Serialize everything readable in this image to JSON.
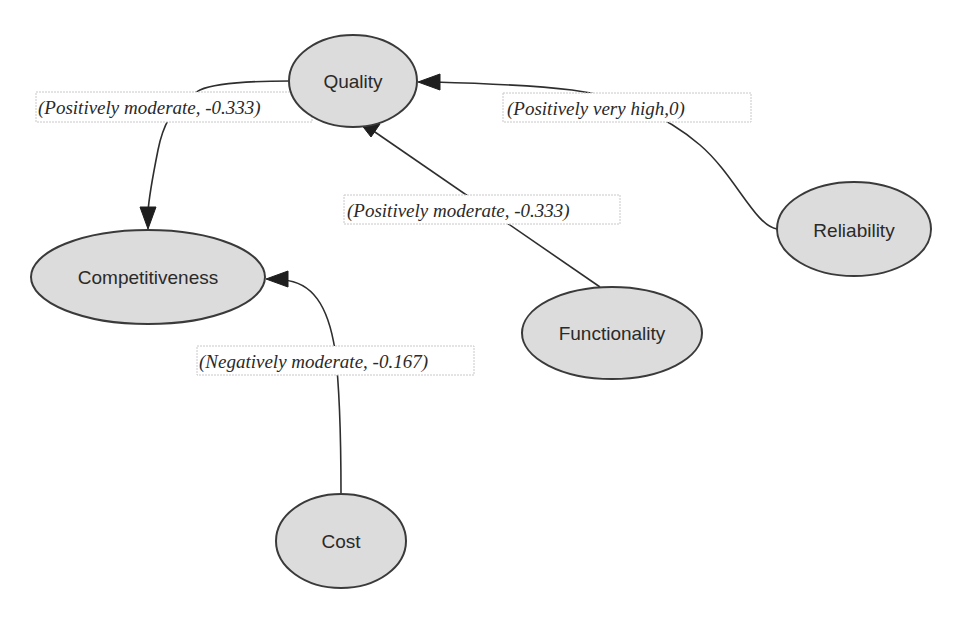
{
  "diagram": {
    "type": "directed-graph",
    "nodes": [
      {
        "id": "quality",
        "label": "Quality"
      },
      {
        "id": "reliability",
        "label": "Reliability"
      },
      {
        "id": "functionality",
        "label": "Functionality"
      },
      {
        "id": "competitiveness",
        "label": "Competitiveness"
      },
      {
        "id": "cost",
        "label": "Cost"
      }
    ],
    "edges": [
      {
        "from": "reliability",
        "to": "quality",
        "label": "(Positively  very  high,0)"
      },
      {
        "from": "functionality",
        "to": "quality",
        "label": "(Positively  moderate, -0.333)"
      },
      {
        "from": "quality",
        "to": "competitiveness",
        "label": "(Positively  moderate, -0.333)"
      },
      {
        "from": "cost",
        "to": "competitiveness",
        "label": "(Negatively moderate, -0.167)"
      }
    ],
    "colors": {
      "node_fill": "#dcdcdc",
      "node_stroke": "#3a3a3a",
      "edge": "#2e2e2e",
      "background": "#ffffff"
    }
  }
}
